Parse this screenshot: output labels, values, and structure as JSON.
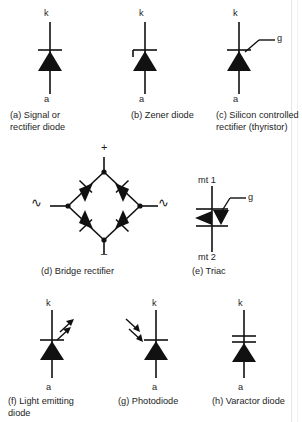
{
  "figure": {
    "background_color": "#ffffff",
    "ink_color": "#111111"
  },
  "symbols": [
    {
      "id": "signal-rectifier-diode",
      "letter": "(a)",
      "caption": "(a) Signal or\n      rectifier diode",
      "terminals": {
        "cathode": "k",
        "anode": "a"
      }
    },
    {
      "id": "zener-diode",
      "letter": "(b)",
      "caption": "(b) Zener diode",
      "terminals": {
        "cathode": "k",
        "anode": "a"
      }
    },
    {
      "id": "silicon-controlled-rectifier",
      "letter": "(c)",
      "caption": "(c) Silicon controlled\n      rectifier (thyristor)",
      "terminals": {
        "cathode": "k",
        "anode": "a",
        "gate": "g"
      }
    },
    {
      "id": "bridge-rectifier",
      "letter": "(d)",
      "caption": "(d) Bridge rectifier",
      "terminals": {
        "positive": "+",
        "negative": "–",
        "ac_left": "∿",
        "ac_right": "∿"
      }
    },
    {
      "id": "triac",
      "letter": "(e)",
      "caption": "(e) Triac",
      "terminals": {
        "main_1": "mt 1",
        "main_2": "mt 2",
        "gate": "g"
      }
    },
    {
      "id": "light-emitting-diode",
      "letter": "(f)",
      "caption": "(f) Light emitting\n     diode",
      "terminals": {
        "cathode": "k",
        "anode": "a"
      }
    },
    {
      "id": "photodiode",
      "letter": "(g)",
      "caption": "(g) Photodiode",
      "terminals": {
        "cathode": "k",
        "anode": "a"
      }
    },
    {
      "id": "varactor-diode",
      "letter": "(h)",
      "caption": "(h) Varactor diode",
      "terminals": {
        "cathode": "k",
        "anode": "a"
      }
    }
  ]
}
